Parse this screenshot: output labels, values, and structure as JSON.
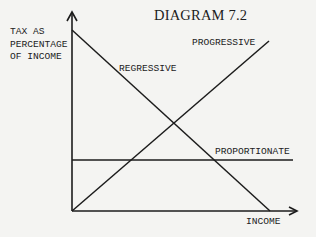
{
  "diagram": {
    "title": "DIAGRAM 7.2",
    "y_axis_label": [
      "TAX AS",
      "PERCENTAGE",
      "OF INCOME"
    ],
    "x_axis_label": "INCOME",
    "lines": [
      {
        "name": "REGRESSIVE",
        "description": "tax rate falls as income rises",
        "direction": "downward"
      },
      {
        "name": "PROGRESSIVE",
        "description": "tax rate rises as income rises",
        "direction": "upward"
      },
      {
        "name": "PROPORTIONATE",
        "description": "constant tax rate at all incomes",
        "direction": "flat"
      }
    ],
    "colors": {
      "background": "#f4f4f2",
      "ink": "#1c1c1c"
    }
  }
}
